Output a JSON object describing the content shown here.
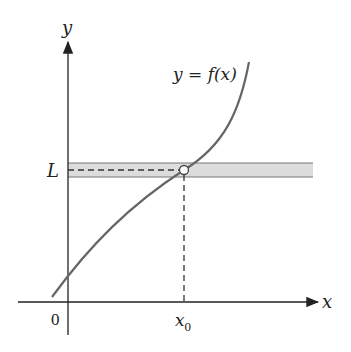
{
  "diagram": {
    "labels": {
      "y_axis": "y",
      "x_axis": "x",
      "origin": "0",
      "curve": "y = f(x)",
      "limit": "L",
      "x0_base": "x",
      "x0_sub": "0"
    },
    "colors": {
      "axis": "#222222",
      "curve": "#666666",
      "band_fill": "#d9d9d9",
      "band_edge": "#777777",
      "dash": "#333333"
    },
    "elements": {
      "curve": "increasing cubic-like curve passing through (x0, L)",
      "band": "horizontal shaded band around y = L",
      "hole": "open circle at (x0, L)",
      "guides": "dashed lines from hole to y-axis and x-axis"
    }
  }
}
